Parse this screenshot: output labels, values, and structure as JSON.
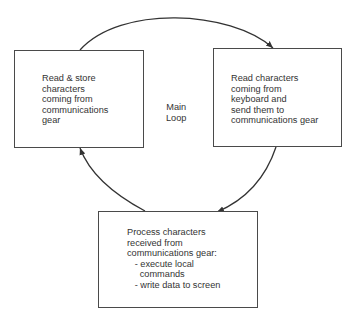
{
  "diagram": {
    "type": "flow-loop",
    "center_label": "Main\nLoop",
    "nodes": [
      {
        "id": "read-store",
        "label": "Read & store\ncharacters\ncoming from\ncommunications\ngear"
      },
      {
        "id": "read-keyboard",
        "label": "Read characters\ncoming from\nkeyboard and\nsend them to\ncommunications gear"
      },
      {
        "id": "process",
        "label": "Process characters\nreceived from\ncommunications gear:\n   - execute local\n     commands\n   - write data to screen"
      }
    ],
    "edges": [
      {
        "from": "read-store",
        "to": "read-keyboard"
      },
      {
        "from": "read-keyboard",
        "to": "process"
      },
      {
        "from": "process",
        "to": "read-store"
      }
    ],
    "colors": {
      "stroke": "#333333",
      "box_border": "#4a4a4a",
      "background": "#ffffff"
    }
  }
}
